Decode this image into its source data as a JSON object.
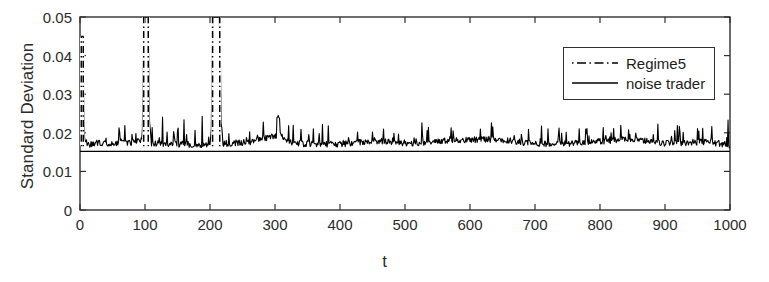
{
  "figure": {
    "width": 769,
    "height": 282,
    "background": "#ffffff",
    "axis_color": "#303030",
    "line_color": "#000000"
  },
  "chart_data": {
    "type": "line",
    "title": "",
    "subtitle": "",
    "xlabel": "t",
    "ylabel": "Standard Deviation",
    "xlim": [
      0,
      1000
    ],
    "ylim": [
      0,
      0.05
    ],
    "grid": false,
    "legend_position": "upper right",
    "xticks": [
      0,
      100,
      200,
      300,
      400,
      500,
      600,
      700,
      800,
      900,
      1000
    ],
    "xtick_labels": [
      "0",
      "100",
      "200",
      "300",
      "400",
      "500",
      "600",
      "700",
      "800",
      "900",
      "1000"
    ],
    "yticks": [
      0,
      0.01,
      0.02,
      0.03,
      0.04,
      0.05
    ],
    "ytick_labels": [
      "0",
      "0.01",
      "0.02",
      "0.03",
      "0.04",
      "0.05"
    ],
    "annotations": [
      "Regime5 series is clipped at the y-axis maximum 0.05 near t=100 and t=210",
      "Initial transient spike near t=2 reaching approximately 0.045"
    ],
    "series": [
      {
        "name": "Regime5",
        "style": "dash-dot",
        "color": "#000000",
        "linewidth": 1,
        "baseline_level": 0.0165,
        "noise_amplitude": 0.0025,
        "clipped_at_ylim": true,
        "key_points": [
          {
            "t": 0,
            "value": 0.0185
          },
          {
            "t": 2,
            "value": 0.045
          },
          {
            "t": 3,
            "value": 0.0395
          },
          {
            "t": 5,
            "value": 0.03
          },
          {
            "t": 8,
            "value": 0.0215
          },
          {
            "t": 12,
            "value": 0.017
          },
          {
            "t": 30,
            "value": 0.0185
          },
          {
            "t": 48,
            "value": 0.0172
          },
          {
            "t": 68,
            "value": 0.0205
          },
          {
            "t": 72,
            "value": 0.0178
          },
          {
            "t": 95,
            "value": 0.02
          },
          {
            "t": 99,
            "value": 0.05
          },
          {
            "t": 104,
            "value": 0.05
          },
          {
            "t": 110,
            "value": 0.018
          },
          {
            "t": 150,
            "value": 0.0175
          },
          {
            "t": 200,
            "value": 0.017
          },
          {
            "t": 205,
            "value": 0.05
          },
          {
            "t": 214,
            "value": 0.05
          },
          {
            "t": 220,
            "value": 0.0178
          },
          {
            "t": 260,
            "value": 0.019
          },
          {
            "t": 305,
            "value": 0.0242
          },
          {
            "t": 330,
            "value": 0.018
          },
          {
            "t": 400,
            "value": 0.0172
          },
          {
            "t": 460,
            "value": 0.02
          },
          {
            "t": 520,
            "value": 0.0175
          },
          {
            "t": 570,
            "value": 0.0205
          },
          {
            "t": 640,
            "value": 0.021
          },
          {
            "t": 700,
            "value": 0.0175
          },
          {
            "t": 770,
            "value": 0.0182
          },
          {
            "t": 850,
            "value": 0.0215
          },
          {
            "t": 900,
            "value": 0.0178
          },
          {
            "t": 960,
            "value": 0.019
          },
          {
            "t": 1000,
            "value": 0.0168
          }
        ]
      },
      {
        "name": "noise trader",
        "style": "solid",
        "color": "#000000",
        "linewidth": 1,
        "constant_value": 0.0152,
        "key_points": [
          {
            "t": 0,
            "value": 0.0152
          },
          {
            "t": 1000,
            "value": 0.0152
          }
        ]
      }
    ]
  },
  "legend": {
    "entries": [
      {
        "label": "Regime5",
        "style": "dash-dot"
      },
      {
        "label": "noise trader",
        "style": "solid"
      }
    ]
  }
}
